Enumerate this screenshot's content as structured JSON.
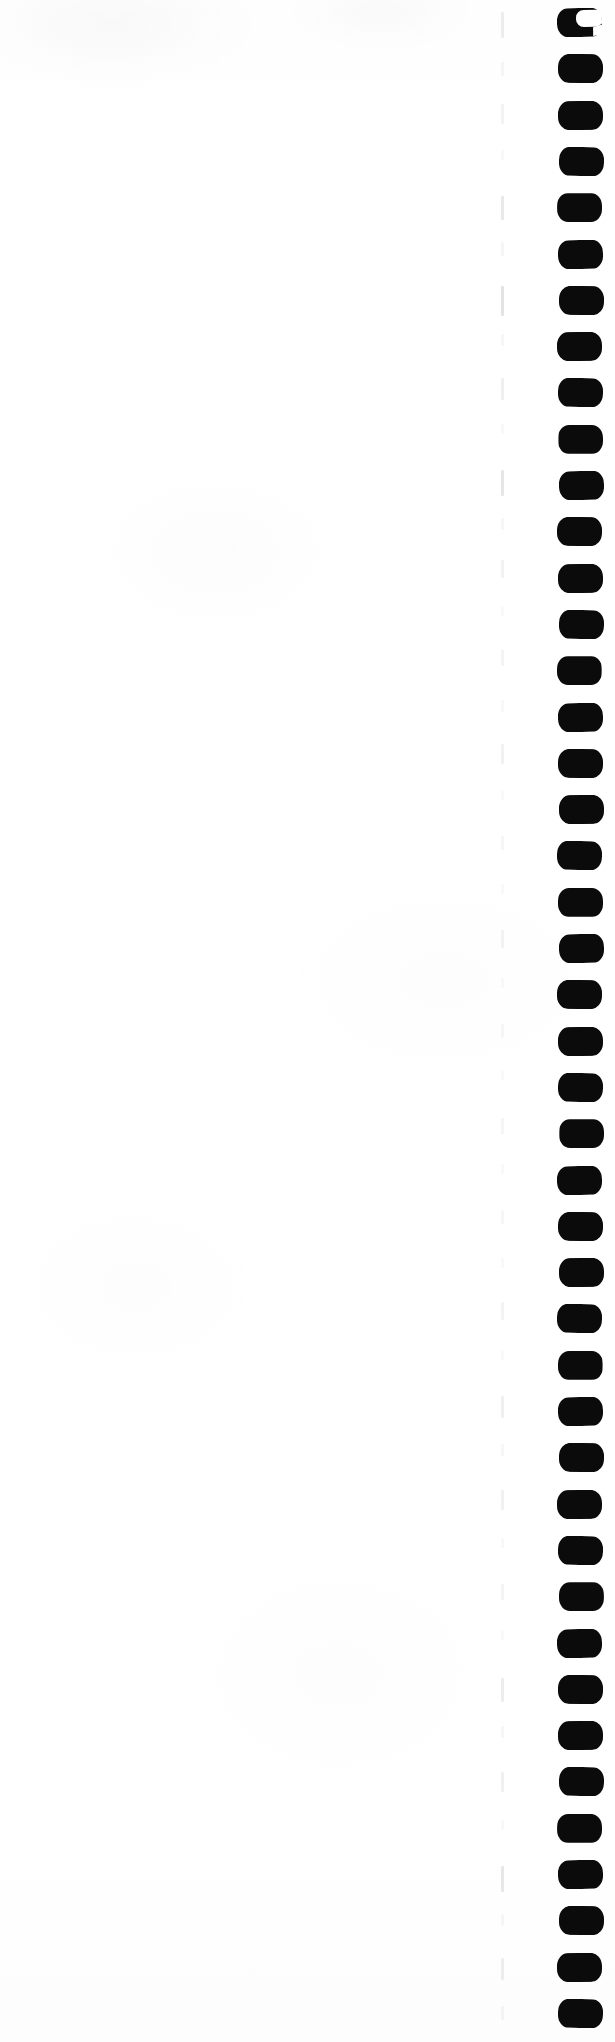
{
  "document": {
    "title": "Scanned page edge",
    "page_width": 615,
    "page_height": 2042,
    "background_color": "#ffffff",
    "ink_color": "#0b0b0b",
    "rule_color": "#c9c9c9"
  },
  "binding_marks": {
    "label": "binding punch marks",
    "count": 44,
    "first_mark_shape": "open-c",
    "mark_shape": "octagon-rounded",
    "left": 558,
    "width": 45,
    "height": 29,
    "pitch": 46.3,
    "start_y": 8,
    "color": "#0b0b0b"
  },
  "dashed_rule": {
    "label": "faint dashed vertical rule",
    "x": 501,
    "color": "#c9c9c9",
    "dashes": [
      {
        "y": 12,
        "h": 26,
        "o": 0.34
      },
      {
        "y": 62,
        "h": 14,
        "o": 0.16
      },
      {
        "y": 104,
        "h": 20,
        "o": 0.22
      },
      {
        "y": 150,
        "h": 10,
        "o": 0.12
      },
      {
        "y": 196,
        "h": 24,
        "o": 0.4
      },
      {
        "y": 242,
        "h": 14,
        "o": 0.18
      },
      {
        "y": 286,
        "h": 30,
        "o": 0.52
      },
      {
        "y": 334,
        "h": 12,
        "o": 0.14
      },
      {
        "y": 378,
        "h": 22,
        "o": 0.3
      },
      {
        "y": 424,
        "h": 10,
        "o": 0.12
      },
      {
        "y": 470,
        "h": 26,
        "o": 0.46
      },
      {
        "y": 518,
        "h": 12,
        "o": 0.15
      },
      {
        "y": 560,
        "h": 18,
        "o": 0.24
      },
      {
        "y": 606,
        "h": 10,
        "o": 0.11
      },
      {
        "y": 650,
        "h": 16,
        "o": 0.2
      },
      {
        "y": 700,
        "h": 12,
        "o": 0.13
      },
      {
        "y": 744,
        "h": 20,
        "o": 0.26
      },
      {
        "y": 790,
        "h": 10,
        "o": 0.1
      },
      {
        "y": 836,
        "h": 14,
        "o": 0.17
      },
      {
        "y": 884,
        "h": 10,
        "o": 0.1
      },
      {
        "y": 930,
        "h": 18,
        "o": 0.22
      },
      {
        "y": 978,
        "h": 10,
        "o": 0.1
      },
      {
        "y": 1024,
        "h": 14,
        "o": 0.16
      },
      {
        "y": 1070,
        "h": 10,
        "o": 0.1
      },
      {
        "y": 1118,
        "h": 16,
        "o": 0.19
      },
      {
        "y": 1164,
        "h": 10,
        "o": 0.1
      },
      {
        "y": 1210,
        "h": 14,
        "o": 0.15
      },
      {
        "y": 1258,
        "h": 10,
        "o": 0.1
      },
      {
        "y": 1302,
        "h": 18,
        "o": 0.22
      },
      {
        "y": 1350,
        "h": 10,
        "o": 0.11
      },
      {
        "y": 1396,
        "h": 22,
        "o": 0.3
      },
      {
        "y": 1444,
        "h": 12,
        "o": 0.14
      },
      {
        "y": 1490,
        "h": 20,
        "o": 0.26
      },
      {
        "y": 1538,
        "h": 10,
        "o": 0.12
      },
      {
        "y": 1584,
        "h": 16,
        "o": 0.2
      },
      {
        "y": 1630,
        "h": 10,
        "o": 0.11
      },
      {
        "y": 1678,
        "h": 24,
        "o": 0.34
      },
      {
        "y": 1726,
        "h": 12,
        "o": 0.14
      },
      {
        "y": 1772,
        "h": 20,
        "o": 0.28
      },
      {
        "y": 1820,
        "h": 10,
        "o": 0.12
      },
      {
        "y": 1866,
        "h": 26,
        "o": 0.42
      },
      {
        "y": 1914,
        "h": 12,
        "o": 0.15
      },
      {
        "y": 1958,
        "h": 22,
        "o": 0.32
      },
      {
        "y": 2006,
        "h": 14,
        "o": 0.18
      }
    ]
  }
}
